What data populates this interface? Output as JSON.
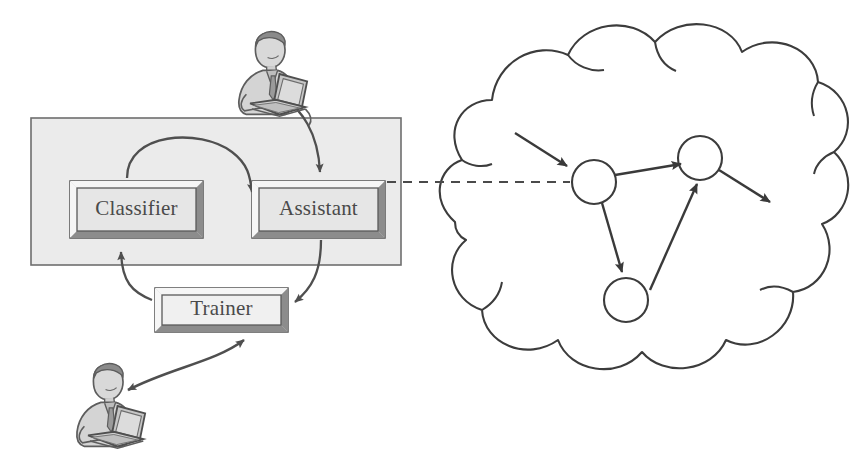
{
  "diagram": {
    "type": "system-architecture",
    "colors": {
      "container_fill": "#ebebeb",
      "container_stroke": "#6e6e6e",
      "box_fill": "#e4e4e4",
      "box_bevel_light": "#f4f4f4",
      "box_bevel_dark": "#8c8c8c",
      "box_stroke": "#555555",
      "label_text": "#4a4a4a",
      "arrow": "#4f4f4f",
      "cloud_stroke": "#3c3c3c",
      "node_stroke": "#3c3c3c",
      "node_fill": "#ffffff",
      "dashed_link": "#4a4a4a",
      "figure_line": "#5d5d5d",
      "figure_fill": "#c9c9c9"
    },
    "container": {
      "name": "system-boundary",
      "x": 31,
      "y": 118,
      "w": 370,
      "h": 147
    },
    "boxes": [
      {
        "id": "classifier",
        "label": "Classifier",
        "x": 70,
        "y": 181,
        "w": 133,
        "h": 57
      },
      {
        "id": "assistant",
        "label": "Assistant",
        "x": 252,
        "y": 181,
        "w": 133,
        "h": 57
      },
      {
        "id": "trainer",
        "label": "Trainer",
        "x": 155,
        "y": 288,
        "w": 133,
        "h": 44
      }
    ],
    "actors": [
      {
        "id": "user-top",
        "label": "person-at-laptop",
        "x": 228,
        "y": 28,
        "w": 88,
        "h": 80
      },
      {
        "id": "user-bottom",
        "label": "person-at-laptop",
        "x": 66,
        "y": 360,
        "w": 88,
        "h": 80
      }
    ],
    "cloud": {
      "id": "network-cloud",
      "label": "network cloud",
      "bbox": {
        "x": 434,
        "y": 18,
        "w": 420,
        "h": 350
      }
    },
    "cloud_nodes": [
      {
        "id": "node-1",
        "cx": 594,
        "cy": 182,
        "r": 22
      },
      {
        "id": "node-2",
        "cx": 700,
        "cy": 158,
        "r": 22
      },
      {
        "id": "node-3",
        "cx": 626,
        "cy": 300,
        "r": 22
      }
    ],
    "connections": [
      {
        "id": "classifier-to-assistant",
        "from": "classifier",
        "to": "assistant",
        "style": "curved-arc",
        "direction": "one-way"
      },
      {
        "id": "assistant-to-trainer",
        "from": "assistant",
        "to": "trainer",
        "style": "curve",
        "direction": "one-way"
      },
      {
        "id": "trainer-to-classifier",
        "from": "trainer",
        "to": "classifier",
        "style": "curve",
        "direction": "one-way"
      },
      {
        "id": "user-top-to-assistant",
        "from": "user-top",
        "to": "assistant",
        "style": "curve",
        "direction": "one-way"
      },
      {
        "id": "user-bottom-to-trainer",
        "from": "user-bottom",
        "to": "trainer",
        "style": "curve",
        "direction": "two-way"
      },
      {
        "id": "assistant-to-cloud",
        "from": "assistant",
        "to": "network-cloud",
        "style": "dashed",
        "direction": "none"
      },
      {
        "id": "cloud-in",
        "from": "external",
        "to": "node-1",
        "style": "straight",
        "direction": "one-way"
      },
      {
        "id": "node1-to-node2",
        "from": "node-1",
        "to": "node-2",
        "style": "straight",
        "direction": "one-way"
      },
      {
        "id": "node1-to-node3",
        "from": "node-1",
        "to": "node-3",
        "style": "straight",
        "direction": "one-way"
      },
      {
        "id": "node3-to-node2",
        "from": "node-3",
        "to": "node-2",
        "style": "straight",
        "direction": "one-way"
      },
      {
        "id": "node2-out",
        "from": "node-2",
        "to": "external",
        "style": "straight",
        "direction": "one-way"
      }
    ]
  }
}
